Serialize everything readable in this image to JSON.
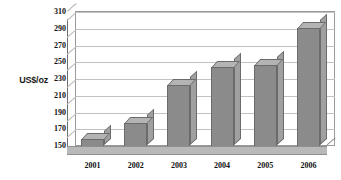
{
  "chart_data": {
    "type": "bar",
    "title": "",
    "subtitle": "",
    "xlabel": "",
    "ylabel": "US$/oz",
    "categories": [
      "2001",
      "2002",
      "2003",
      "2004",
      "2005",
      "2006"
    ],
    "values": [
      168,
      187,
      232,
      254,
      256,
      301
    ],
    "ylim": [
      150,
      310
    ],
    "y_ticks": [
      310,
      290,
      270,
      250,
      230,
      210,
      190,
      170,
      150
    ],
    "grid": true,
    "legend": false,
    "legend_position": "none",
    "style": "3d-column",
    "series": [
      {
        "name": "US$/oz",
        "values": [
          168,
          187,
          232,
          254,
          256,
          301
        ]
      }
    ],
    "colors": {
      "bar_front": "#8b8b8b",
      "bar_top": "#b4b4b4",
      "bar_side": "#a0a0a0",
      "bar_edge": "#6b6b6b",
      "gridline": "#c2c2c2",
      "plot_border": "#9a9a9a",
      "floor": "#b9b9b9",
      "text": "#111111",
      "background": "#ffffff"
    }
  }
}
